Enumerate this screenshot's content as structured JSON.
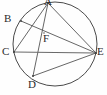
{
  "figure": {
    "background_color": "#fefefe",
    "stroke_color": "#555555",
    "label_color": "#2b2b2b"
  },
  "circle": {
    "name": "circumscribed-circle",
    "cx": 55,
    "cy": 44,
    "r": 42
  },
  "points": [
    {
      "id": "A",
      "label": "A",
      "x": 48,
      "y": 3,
      "label_x": 44,
      "label_y": -4,
      "on_circle": true
    },
    {
      "id": "B",
      "label": "B",
      "x": 21,
      "y": 21,
      "label_x": 4,
      "label_y": 13,
      "on_circle": true
    },
    {
      "id": "C",
      "label": "C",
      "x": 14,
      "y": 52,
      "label_x": 2,
      "label_y": 46,
      "on_circle": true
    },
    {
      "id": "D",
      "label": "D",
      "x": 33,
      "y": 76,
      "label_x": 28,
      "label_y": 79,
      "on_circle": true
    },
    {
      "id": "E",
      "label": "E",
      "x": 96,
      "y": 53,
      "label_x": 97,
      "label_y": 46,
      "on_circle": true
    },
    {
      "id": "F",
      "label": "F",
      "x": 44,
      "y": 33,
      "label_x": 43,
      "label_y": 33,
      "on_circle": false
    }
  ],
  "segments": [
    {
      "id": "AC",
      "from": "A",
      "to": "C",
      "style": "chord"
    },
    {
      "id": "AD",
      "from": "A",
      "to": "D",
      "style": "chord"
    },
    {
      "id": "AE",
      "from": "A",
      "to": "E",
      "style": "chord"
    },
    {
      "id": "BE",
      "from": "B",
      "to": "E",
      "style": "chord"
    },
    {
      "id": "CE",
      "from": "C",
      "to": "E",
      "style": "chord-diameter"
    },
    {
      "id": "DE",
      "from": "D",
      "to": "E",
      "style": "chord"
    }
  ],
  "intersections": [
    {
      "id": "F",
      "of": [
        "AD",
        "BE"
      ],
      "x": 44,
      "y": 33
    }
  ]
}
